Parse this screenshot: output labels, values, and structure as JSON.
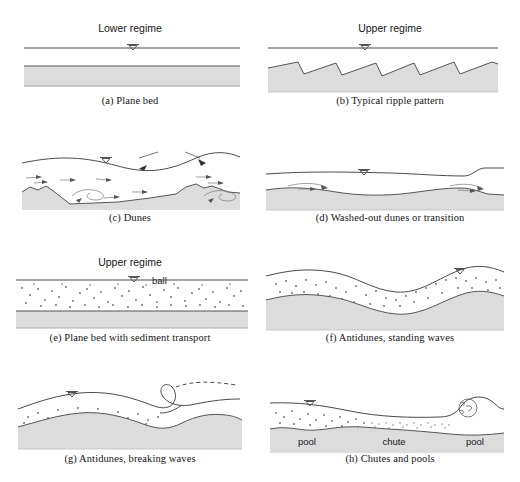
{
  "figure": {
    "colors": {
      "bed_fill": "#dcdcdc",
      "bed_line": "#555555",
      "water_line": "#4a4a4a",
      "sediment_dot": "#6b6b6b",
      "background": "#ffffff"
    }
  },
  "panels": [
    {
      "id": "a",
      "caption": "(a) Plane bed",
      "regime": "Lower regime",
      "water_symbol": "water-surface-triangle",
      "bed_type": "plane"
    },
    {
      "id": "b",
      "caption": "(b) Typical ripple pattern",
      "regime": "Upper regime",
      "water_symbol": "water-surface-triangle",
      "bed_type": "ripples",
      "crest_count": 5
    },
    {
      "id": "c",
      "caption": "(c) Dunes",
      "regime": "",
      "water_symbol": "water-surface-triangle",
      "bed_type": "dunes",
      "annotation": "ball",
      "annotation_arrows": 2
    },
    {
      "id": "d",
      "caption": "(d) Washed-out dunes or transition",
      "regime": "",
      "water_symbol": "water-surface-triangle",
      "bed_type": "washed-out-dunes"
    },
    {
      "id": "e",
      "caption": "(e) Plane bed with sediment transport",
      "regime": "Upper regime",
      "water_symbol": "water-surface-triangle",
      "bed_type": "plane-with-transport"
    },
    {
      "id": "f",
      "caption": "(f) Antidunes, standing waves",
      "regime": "",
      "water_symbol": "water-surface-triangle",
      "bed_type": "antidunes-standing"
    },
    {
      "id": "g",
      "caption": "(g) Antidunes, breaking waves",
      "regime": "",
      "water_symbol": "water-surface-triangle",
      "bed_type": "antidunes-breaking",
      "annotation_line1": "Breaking",
      "annotation_line2": "antidune"
    },
    {
      "id": "h",
      "caption": "(h) Chutes and pools",
      "regime": "",
      "water_symbol": "water-surface-triangle",
      "bed_type": "chutes-and-pools",
      "bed_labels": [
        "pool",
        "chute",
        "pool"
      ]
    }
  ]
}
